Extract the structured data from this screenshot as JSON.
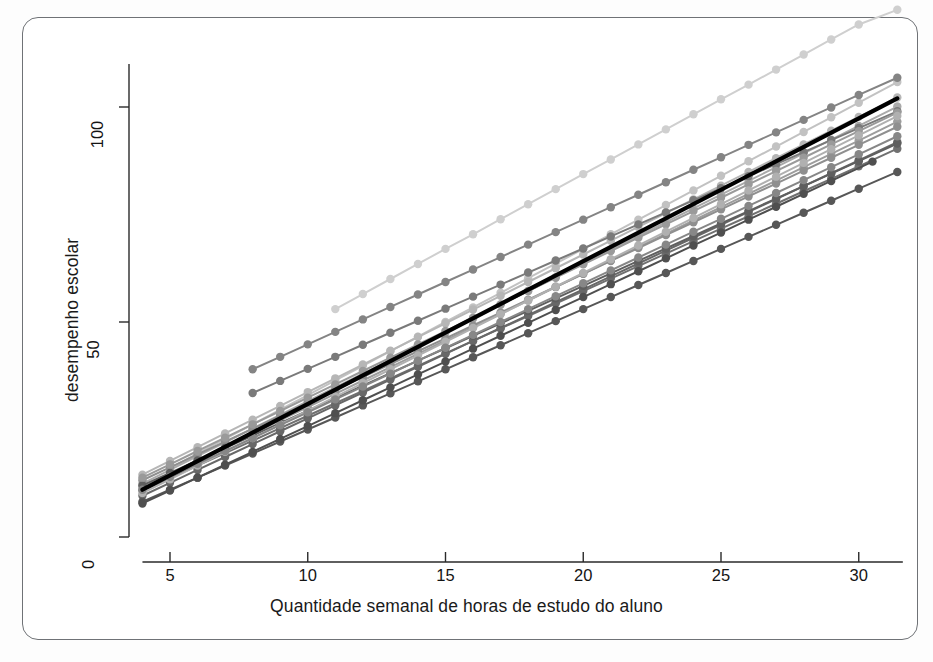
{
  "chart_data": {
    "type": "line",
    "title": "",
    "subtitle": "",
    "xlabel": "Quantidade semanal de horas de estudo do aluno",
    "ylabel": "desempenho escolar",
    "xlim": [
      3.2,
      32.3
    ],
    "ylim": [
      -4,
      118
    ],
    "xticks": [
      5,
      10,
      15,
      20,
      25,
      30
    ],
    "yticks": [
      0,
      50,
      100
    ],
    "grid": false,
    "legend": false,
    "legend_position": "none",
    "marker": "filled-circle",
    "annotations": [
      "Spaghetti plot: one gray line with circular markers per student (random-intercept / random-slope fits)",
      "Thick black line is the overall average fitted line"
    ],
    "series": [
      {
        "name": "aluno-01",
        "color": "#cfcfcf",
        "width": 2.0,
        "x": [
          11,
          12,
          13,
          14,
          15,
          16,
          17,
          18,
          19,
          20,
          21,
          22,
          23,
          24,
          25,
          26,
          27,
          28,
          29,
          30,
          31.4
        ],
        "values": [
          53.0,
          56.5,
          60.0,
          63.5,
          67.0,
          70.4,
          73.9,
          77.4,
          80.9,
          84.4,
          87.8,
          91.3,
          94.8,
          98.3,
          101.8,
          105.2,
          108.7,
          112.2,
          115.7,
          119.2,
          122.6
        ]
      },
      {
        "name": "aluno-02",
        "color": "#c2c2c2",
        "width": 2.0,
        "x": [
          5,
          6,
          7,
          8,
          9,
          10,
          11,
          12,
          13,
          14,
          15,
          16,
          17,
          18,
          19,
          20,
          21,
          22,
          23,
          24,
          25,
          26,
          27,
          28,
          29,
          30,
          31.4
        ],
        "values": [
          16.0,
          19.4,
          22.8,
          26.2,
          29.6,
          33.0,
          36.4,
          39.8,
          43.2,
          46.6,
          50.0,
          53.4,
          56.8,
          60.2,
          63.6,
          67.0,
          70.4,
          73.8,
          77.2,
          80.6,
          84.0,
          87.4,
          90.8,
          94.2,
          97.6,
          101.0,
          105.8
        ]
      },
      {
        "name": "aluno-03",
        "color": "#b6b6b6",
        "width": 2.0,
        "x": [
          4,
          5,
          6,
          7,
          8,
          9,
          10,
          11,
          12,
          13,
          14,
          15,
          16,
          17,
          18,
          19,
          20,
          21,
          22,
          23,
          24,
          25,
          26,
          27,
          28,
          29,
          30,
          31.4
        ],
        "values": [
          14.5,
          17.7,
          20.9,
          24.1,
          27.3,
          30.5,
          33.7,
          36.9,
          40.1,
          43.3,
          46.5,
          49.7,
          52.9,
          56.1,
          59.3,
          62.5,
          65.7,
          68.9,
          72.1,
          75.3,
          78.5,
          81.7,
          84.9,
          88.1,
          91.3,
          94.5,
          97.7,
          102.2
        ]
      },
      {
        "name": "aluno-04",
        "color": "#aaaaaa",
        "width": 2.0,
        "x": [
          4,
          5,
          6,
          7,
          8,
          9,
          10,
          11,
          12,
          13,
          14,
          15,
          16,
          17,
          18,
          19,
          20,
          21,
          22,
          23,
          24,
          25,
          26,
          27,
          28,
          29,
          30,
          31.4
        ],
        "values": [
          12.4,
          15.6,
          18.8,
          22.0,
          25.2,
          28.4,
          31.6,
          34.8,
          38.0,
          41.2,
          44.4,
          47.6,
          50.8,
          54.0,
          57.2,
          60.4,
          63.6,
          66.8,
          70.0,
          73.2,
          76.4,
          79.6,
          82.8,
          86.0,
          89.2,
          92.4,
          95.6,
          100.1
        ]
      },
      {
        "name": "aluno-05",
        "color": "#9d9d9d",
        "width": 2.0,
        "x": [
          4,
          5,
          6,
          7,
          8,
          9,
          10,
          11,
          12,
          13,
          14,
          15,
          16,
          17,
          18,
          19,
          20,
          21,
          22,
          23,
          24,
          25,
          26,
          27,
          28,
          29,
          30,
          31.4
        ],
        "values": [
          11.6,
          14.7,
          17.8,
          20.9,
          24.0,
          27.1,
          30.2,
          33.3,
          36.4,
          39.5,
          42.6,
          45.7,
          48.8,
          51.9,
          55.0,
          58.1,
          61.2,
          64.3,
          67.4,
          70.5,
          73.6,
          76.7,
          79.8,
          82.9,
          86.0,
          89.1,
          92.2,
          96.6
        ]
      },
      {
        "name": "aluno-06",
        "color": "#8f8f8f",
        "width": 2.0,
        "x": [
          4,
          5,
          6,
          7,
          8,
          9,
          10,
          11,
          12,
          13,
          14,
          15,
          16,
          17,
          18,
          19,
          20,
          21,
          22,
          23,
          24,
          25,
          26,
          27,
          28,
          29,
          30,
          31.4
        ],
        "values": [
          13.2,
          16.2,
          19.2,
          22.2,
          25.2,
          28.2,
          31.2,
          34.2,
          37.2,
          40.2,
          43.2,
          46.2,
          49.2,
          52.2,
          55.2,
          58.2,
          61.2,
          64.2,
          67.2,
          70.2,
          73.2,
          76.2,
          79.2,
          82.2,
          85.2,
          88.2,
          91.2,
          95.4
        ]
      },
      {
        "name": "aluno-07",
        "color": "#848484",
        "width": 2.0,
        "x": [
          8,
          9,
          10,
          11,
          12,
          13,
          14,
          15,
          16,
          17,
          18,
          19,
          20,
          21,
          22,
          23,
          24,
          25,
          26,
          27,
          28,
          29,
          30,
          31.4
        ],
        "values": [
          39.0,
          41.9,
          44.8,
          47.7,
          50.6,
          53.5,
          56.4,
          59.3,
          62.2,
          65.1,
          68.0,
          70.9,
          73.8,
          76.7,
          79.6,
          82.5,
          85.4,
          88.3,
          91.2,
          94.1,
          97.0,
          99.9,
          102.8,
          106.8
        ]
      },
      {
        "name": "aluno-08",
        "color": "#7a7a7a",
        "width": 2.0,
        "x": [
          8,
          9,
          10,
          11,
          12,
          13,
          14,
          15,
          16,
          17,
          18,
          19,
          20,
          21,
          22,
          23,
          24,
          25,
          26,
          27,
          28,
          29,
          30,
          31.4
        ],
        "values": [
          33.5,
          36.3,
          39.1,
          41.9,
          44.7,
          47.5,
          50.3,
          53.1,
          55.9,
          58.7,
          61.5,
          64.3,
          67.1,
          69.9,
          72.7,
          75.5,
          78.3,
          81.1,
          83.9,
          86.7,
          89.5,
          92.3,
          95.1,
          99.0
        ]
      },
      {
        "name": "aluno-09",
        "color": "#707070",
        "width": 2.0,
        "x": [
          4,
          5,
          6,
          7,
          8,
          9,
          10,
          11,
          12,
          13,
          14,
          15,
          16,
          17,
          18,
          19,
          20,
          21,
          22,
          23,
          24,
          25,
          26,
          27,
          28,
          29,
          30,
          31.4
        ],
        "values": [
          10.8,
          13.7,
          16.6,
          19.5,
          22.4,
          25.3,
          28.2,
          31.1,
          34.0,
          36.9,
          39.8,
          42.7,
          45.6,
          48.5,
          51.4,
          54.3,
          57.2,
          60.1,
          63.0,
          65.9,
          68.8,
          71.7,
          74.6,
          77.5,
          80.4,
          83.3,
          86.2,
          90.3
        ]
      },
      {
        "name": "aluno-10",
        "color": "#686868",
        "width": 2.0,
        "x": [
          4,
          5,
          6,
          7,
          8,
          9,
          10,
          11,
          12,
          13,
          14,
          15,
          16,
          17,
          18,
          19,
          20,
          21,
          22,
          23,
          24,
          25,
          26,
          27,
          28,
          29,
          30,
          31.4
        ],
        "values": [
          9.6,
          12.6,
          15.6,
          18.6,
          21.6,
          24.6,
          27.6,
          30.6,
          33.6,
          36.6,
          39.6,
          42.6,
          45.6,
          48.6,
          51.6,
          54.6,
          57.6,
          60.6,
          63.6,
          66.6,
          69.6,
          72.6,
          75.6,
          78.6,
          81.6,
          84.6,
          87.6,
          91.8
        ]
      },
      {
        "name": "aluno-11",
        "color": "#5f5f5f",
        "width": 2.0,
        "x": [
          4,
          5,
          6,
          7,
          8,
          9,
          10,
          11,
          12,
          13,
          14,
          15,
          16,
          17,
          18,
          19,
          20,
          21,
          22,
          23,
          24,
          25,
          26,
          27,
          28,
          29,
          30,
          31.4
        ],
        "values": [
          12.0,
          14.9,
          17.8,
          20.7,
          23.6,
          26.5,
          29.4,
          32.3,
          35.2,
          38.1,
          41.0,
          43.9,
          46.8,
          49.7,
          52.6,
          55.5,
          58.4,
          61.3,
          64.2,
          67.1,
          70.0,
          72.9,
          75.8,
          78.7,
          81.6,
          84.5,
          87.4,
          91.5
        ]
      },
      {
        "name": "aluno-12",
        "color": "#575757",
        "width": 2.0,
        "x": [
          4,
          5,
          6,
          7,
          8,
          9,
          10,
          11,
          12,
          13,
          14,
          15,
          16,
          17,
          18,
          19,
          20,
          21,
          22,
          23,
          24,
          25,
          26,
          27,
          28,
          29,
          30,
          31.4
        ],
        "values": [
          8.2,
          11.0,
          13.8,
          16.6,
          19.4,
          22.2,
          25.0,
          27.8,
          30.6,
          33.4,
          36.2,
          39.0,
          41.8,
          44.6,
          47.4,
          50.2,
          53.0,
          55.8,
          58.6,
          61.4,
          64.2,
          67.0,
          69.8,
          72.6,
          75.4,
          78.2,
          81.0,
          84.9
        ]
      },
      {
        "name": "aluno-13",
        "color": "#4f4f4f",
        "width": 2.0,
        "x": [
          4,
          5,
          6,
          7,
          8,
          9,
          10,
          11,
          12,
          13,
          14,
          15,
          16,
          17,
          18,
          19,
          20,
          21,
          22,
          23,
          24,
          25,
          26,
          27,
          28,
          29,
          30.5
        ],
        "values": [
          7.8,
          10.8,
          13.8,
          16.8,
          19.8,
          22.8,
          25.8,
          28.8,
          31.8,
          34.8,
          37.8,
          40.8,
          43.8,
          46.8,
          49.8,
          52.8,
          55.8,
          58.8,
          61.8,
          64.8,
          67.8,
          70.8,
          73.8,
          76.8,
          79.8,
          82.8,
          87.3
        ]
      },
      {
        "name": "aluno-14",
        "color": "#9a9a9a",
        "width": 2.0,
        "x": [
          4,
          5,
          6,
          7,
          8,
          9,
          10,
          11,
          12,
          13,
          14,
          15,
          16,
          17,
          18,
          19,
          20,
          21,
          22,
          23,
          24,
          25,
          26,
          27,
          28,
          29,
          30,
          31.4
        ],
        "values": [
          13.8,
          16.9,
          20.0,
          23.1,
          26.2,
          29.3,
          32.4,
          35.5,
          38.6,
          41.7,
          44.8,
          47.9,
          51.0,
          54.1,
          57.2,
          60.3,
          63.4,
          66.5,
          69.6,
          72.7,
          75.8,
          78.9,
          82.0,
          85.1,
          88.2,
          91.3,
          94.4,
          98.7
        ]
      },
      {
        "name": "aluno-15",
        "color": "#b0b0b0",
        "width": 2.0,
        "x": [
          4,
          5,
          6,
          7,
          8,
          9,
          10,
          11,
          12,
          13,
          14,
          15,
          16,
          17,
          18,
          19,
          20,
          21,
          22,
          23,
          24,
          25,
          26,
          27,
          28,
          29,
          30,
          31.4
        ],
        "values": [
          10.2,
          13.4,
          16.6,
          19.8,
          23.0,
          26.2,
          29.4,
          32.6,
          35.8,
          39.0,
          42.2,
          45.4,
          48.6,
          51.8,
          55.0,
          58.2,
          61.4,
          64.6,
          67.8,
          71.0,
          74.2,
          77.4,
          80.6,
          83.8,
          87.0,
          90.2,
          93.4,
          97.9
        ]
      },
      {
        "name": "aluno-16",
        "color": "#878787",
        "width": 2.0,
        "x": [
          4,
          5,
          6,
          7,
          8,
          9,
          10,
          11,
          12,
          13,
          14,
          15,
          16,
          17,
          18,
          19,
          20,
          21,
          22,
          23,
          24,
          25,
          26,
          27,
          28,
          29,
          30,
          31.4
        ],
        "values": [
          11.0,
          14.0,
          17.0,
          20.0,
          23.0,
          26.0,
          29.0,
          32.0,
          35.0,
          38.0,
          41.0,
          44.0,
          47.0,
          50.0,
          53.0,
          56.0,
          59.0,
          62.0,
          65.0,
          68.0,
          71.0,
          74.0,
          77.0,
          80.0,
          83.0,
          86.0,
          89.0,
          93.2
        ]
      },
      {
        "name": "media-geral",
        "color": "#000000",
        "width": 4.2,
        "x": [
          4,
          31.4
        ],
        "values": [
          11.0,
          102.0
        ],
        "is_average": true
      }
    ]
  }
}
